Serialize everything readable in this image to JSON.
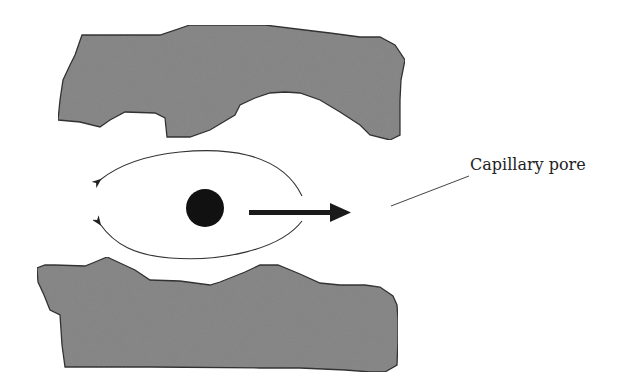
{
  "diagram": {
    "label": "Capillary pore",
    "colors": {
      "solid_fill": "#8a8a8a",
      "solid_stroke": "#333333",
      "particle": "#111111",
      "arrow": "#1a1a1a",
      "flow_lines": "#333333"
    },
    "elements": {
      "top_solid": "solid-grain-top",
      "bottom_solid": "solid-grain-bottom",
      "particle": "particle",
      "motion_arrow": "thick-arrow-right",
      "flow_lines": [
        "curved-arrow-upper-left",
        "curved-arrow-lower-left"
      ],
      "leader_line": "label-leader-line"
    }
  }
}
